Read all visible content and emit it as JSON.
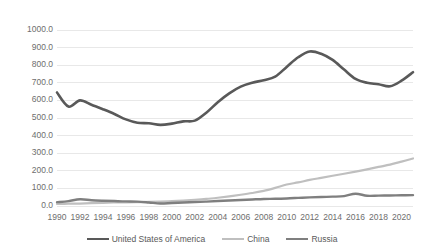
{
  "chart_data": {
    "type": "line",
    "title": "",
    "xlabel": "",
    "ylabel": "",
    "grid": true,
    "legend_position": "bottom",
    "ylim": [
      0,
      1000
    ],
    "xlim": [
      1990,
      2021
    ],
    "y_ticks": [
      "0.0",
      "100.0",
      "200.0",
      "300.0",
      "400.0",
      "500.0",
      "600.0",
      "700.0",
      "800.0",
      "900.0",
      "1000.0"
    ],
    "y_tick_values": [
      0,
      100,
      200,
      300,
      400,
      500,
      600,
      700,
      800,
      900,
      1000
    ],
    "x_tick_labels": [
      "1990",
      "1992",
      "1994",
      "1996",
      "1998",
      "2000",
      "2002",
      "2004",
      "2006",
      "2008",
      "2010",
      "2012",
      "2014",
      "2016",
      "2018",
      "2020"
    ],
    "x_tick_values": [
      1990,
      1992,
      1994,
      1996,
      1998,
      2000,
      2002,
      2004,
      2006,
      2008,
      2010,
      2012,
      2014,
      2016,
      2018,
      2020
    ],
    "x": [
      1990,
      1991,
      1992,
      1993,
      1994,
      1995,
      1996,
      1997,
      1998,
      1999,
      2000,
      2001,
      2002,
      2003,
      2004,
      2005,
      2006,
      2007,
      2008,
      2009,
      2010,
      2011,
      2012,
      2013,
      2014,
      2015,
      2016,
      2017,
      2018,
      2019,
      2020,
      2021
    ],
    "series": [
      {
        "name": "United States of America",
        "color": "#595959",
        "width": 2.6,
        "values": [
          645,
          565,
          600,
          575,
          550,
          523,
          492,
          473,
          470,
          461,
          468,
          481,
          485,
          530,
          590,
          640,
          678,
          700,
          715,
          735,
          790,
          845,
          878,
          865,
          830,
          775,
          722,
          700,
          692,
          680,
          712,
          760
        ]
      },
      {
        "name": "China",
        "color": "#bfbfbf",
        "width": 2.2,
        "values": [
          12,
          13,
          14,
          16,
          18,
          20,
          21,
          22,
          23,
          25,
          28,
          31,
          35,
          40,
          47,
          55,
          64,
          74,
          86,
          103,
          122,
          134,
          148,
          160,
          172,
          183,
          195,
          208,
          222,
          235,
          252,
          270
        ]
      },
      {
        "name": "Russia",
        "color": "#7f7f7f",
        "width": 2.4,
        "values": [
          22,
          28,
          38,
          33,
          30,
          28,
          26,
          25,
          20,
          14,
          17,
          20,
          22,
          25,
          28,
          31,
          34,
          37,
          40,
          41,
          43,
          46,
          49,
          51,
          53,
          56,
          70,
          58,
          59,
          60,
          61,
          62
        ]
      }
    ]
  },
  "legend": {
    "items": [
      {
        "label": "United States of America",
        "color": "#595959"
      },
      {
        "label": "China",
        "color": "#bfbfbf"
      },
      {
        "label": "Russia",
        "color": "#7f7f7f"
      }
    ]
  },
  "axes": {
    "grid_color": "#e8e8e8",
    "tick_text_color": "#6e6e6e"
  }
}
